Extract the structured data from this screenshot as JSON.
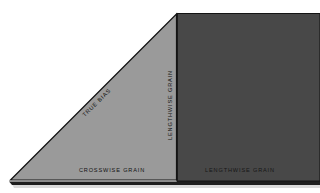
{
  "figure": {
    "background_color": "#ffffff",
    "regions": {
      "bias_triangle": {
        "name": "bias-triangle",
        "fill_color": "#9a9a9a",
        "stroke_color": "#1a1a1a",
        "points": "10,180 177,180 177,14"
      },
      "lengthwise_panel": {
        "name": "lengthwise-panel",
        "fill_color": "#484848",
        "stroke_color": "#1a1a1a",
        "points": "177,14 320,14 320,180 177,180"
      },
      "shadow_edge": {
        "name": "bottom-shadow-edge",
        "fill_color": "#2a2a2a"
      }
    },
    "labels": {
      "true_bias": "TRUE BIAS",
      "lengthwise_grain_vertical": "LENGTHWISE  GRAIN",
      "crosswise_grain": "CROSSWISE  GRAIN",
      "lengthwise_grain_bottom": "LENGTHWISE  GRAIN"
    }
  }
}
